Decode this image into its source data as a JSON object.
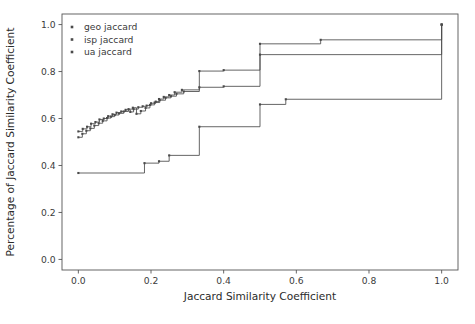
{
  "figure": {
    "background_color": "#ffffff",
    "plot_area": {
      "left": 62,
      "top": 14,
      "right": 458,
      "bottom": 270
    }
  },
  "chart_data": {
    "type": "line",
    "subtype": "step-post",
    "title": "",
    "subtitle": "",
    "xlabel": "Jaccard Similarity Coefficient",
    "ylabel": "Percentage of Jaccard Similarity Coefficient",
    "xlim": [
      -0.045,
      1.045
    ],
    "ylim": [
      -0.045,
      1.045
    ],
    "xticks": [
      0.0,
      0.2,
      0.4,
      0.6,
      0.8,
      1.0
    ],
    "xticklabels": [
      "0.0",
      "0.2",
      "0.4",
      "0.6",
      "0.8",
      "1.0"
    ],
    "yticks": [
      0.0,
      0.2,
      0.4,
      0.6,
      0.8,
      1.0
    ],
    "yticklabels": [
      "0.0",
      "0.2",
      "0.4",
      "0.6",
      "0.8",
      "1.0"
    ],
    "grid": false,
    "legend_position": "upper left",
    "legend_frame": false,
    "marker": "square",
    "marker_size": 2.1,
    "series": [
      {
        "name": "geo jaccard",
        "color": "#4a4a4a",
        "x": [
          0.0,
          0.012,
          0.024,
          0.035,
          0.047,
          0.058,
          0.07,
          0.082,
          0.094,
          0.105,
          0.118,
          0.13,
          0.143,
          0.152,
          0.165,
          0.177,
          0.188,
          0.2,
          0.213,
          0.222,
          0.235,
          0.25,
          0.265,
          0.285,
          0.333,
          0.4,
          0.5,
          0.667,
          1.0
        ],
        "y": [
          0.545,
          0.556,
          0.565,
          0.578,
          0.585,
          0.596,
          0.6,
          0.61,
          0.618,
          0.625,
          0.63,
          0.637,
          0.628,
          0.64,
          0.648,
          0.652,
          0.655,
          0.665,
          0.672,
          0.683,
          0.692,
          0.7,
          0.712,
          0.722,
          0.802,
          0.806,
          0.918,
          0.935,
          1.0
        ]
      },
      {
        "name": "isp jaccard",
        "color": "#4a4a4a",
        "x": [
          0.0,
          0.011,
          0.022,
          0.033,
          0.044,
          0.056,
          0.067,
          0.079,
          0.09,
          0.1,
          0.112,
          0.125,
          0.138,
          0.15,
          0.16,
          0.172,
          0.185,
          0.197,
          0.21,
          0.224,
          0.24,
          0.255,
          0.27,
          0.29,
          0.333,
          0.4,
          0.5,
          1.0
        ],
        "y": [
          0.52,
          0.535,
          0.548,
          0.558,
          0.57,
          0.58,
          0.59,
          0.602,
          0.608,
          0.615,
          0.622,
          0.63,
          0.64,
          0.646,
          0.62,
          0.632,
          0.645,
          0.658,
          0.668,
          0.678,
          0.688,
          0.695,
          0.705,
          0.715,
          0.733,
          0.737,
          0.872,
          1.0
        ]
      },
      {
        "name": "ua jaccard",
        "color": "#4a4a4a",
        "x": [
          0.0,
          0.182,
          0.222,
          0.25,
          0.333,
          0.5,
          0.571,
          1.0
        ],
        "y": [
          0.368,
          0.41,
          0.418,
          0.443,
          0.565,
          0.66,
          0.682,
          1.0
        ]
      }
    ]
  },
  "legend": {
    "items": [
      {
        "label": "geo jaccard",
        "color": "#4a4a4a"
      },
      {
        "label": "isp jaccard",
        "color": "#4a4a4a"
      },
      {
        "label": "ua jaccard",
        "color": "#4a4a4a"
      }
    ]
  }
}
